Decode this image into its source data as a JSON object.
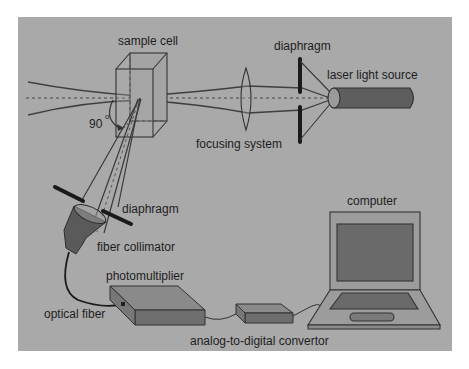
{
  "diagram": {
    "colors": {
      "background": "#ffffff",
      "panel": "#a9a9a9",
      "line": "#3a3a3a",
      "dark_fill": "#5f5f5f",
      "device_top": "#8a8a8a",
      "device_side": "#6e6e6e",
      "laptop_body": "#9c9c9c",
      "laptop_screen": "#6a6a6a"
    },
    "labels": {
      "sample_cell": "sample cell",
      "diaphragm_top": "diaphragm",
      "laser_light_source": "laser light source",
      "focusing_system": "focusing system",
      "angle": "90",
      "degree": "o",
      "diaphragm_bottom": "diaphragm",
      "fiber_collimator": "fiber collimator",
      "photomultiplier": "photomultiplier",
      "optical_fiber": "optical fiber",
      "analog_to_digital_convertor": "analog-to-digital convertor",
      "computer": "computer"
    }
  }
}
